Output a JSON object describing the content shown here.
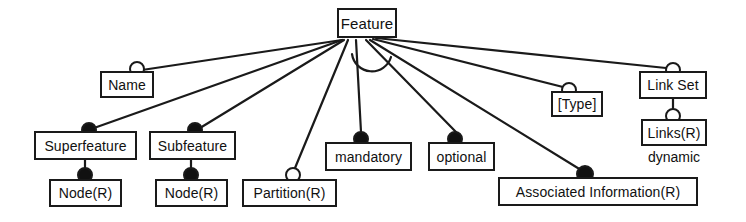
{
  "diagram": {
    "title": "Feature",
    "caption_labels": [
      "dynamic"
    ],
    "colors": {
      "line": "#1a1a1a",
      "box_border": "#1a1a1a",
      "box_fill": "#ffffff",
      "filled_marker": "#111111",
      "open_marker": "#ffffff",
      "text": "#111111"
    },
    "nodes": [
      {
        "id": "feature",
        "label": "Feature",
        "x": 337,
        "y": 8,
        "w": 60,
        "h": 30,
        "font_size": 15
      },
      {
        "id": "name",
        "label": "Name",
        "x": 100,
        "y": 71,
        "w": 54,
        "h": 27,
        "font_size": 14
      },
      {
        "id": "superfeature",
        "label": "Superfeature",
        "x": 34,
        "y": 131,
        "w": 103,
        "h": 29,
        "font_size": 14
      },
      {
        "id": "subfeature",
        "label": "Subfeature",
        "x": 149,
        "y": 131,
        "w": 87,
        "h": 29,
        "font_size": 14
      },
      {
        "id": "node_super",
        "label": "Node(R)",
        "x": 49,
        "y": 179,
        "w": 73,
        "h": 28,
        "font_size": 14
      },
      {
        "id": "node_sub",
        "label": "Node(R)",
        "x": 155,
        "y": 179,
        "w": 73,
        "h": 28,
        "font_size": 14
      },
      {
        "id": "partition",
        "label": "Partition(R)",
        "x": 242,
        "y": 179,
        "w": 95,
        "h": 28,
        "font_size": 14
      },
      {
        "id": "mandatory",
        "label": "mandatory",
        "x": 325,
        "y": 142,
        "w": 87,
        "h": 29,
        "font_size": 14
      },
      {
        "id": "optional",
        "label": "optional",
        "x": 428,
        "y": 142,
        "w": 67,
        "h": 29,
        "font_size": 14
      },
      {
        "id": "type",
        "label": "[Type]",
        "x": 551,
        "y": 91,
        "w": 52,
        "h": 26,
        "font_size": 14
      },
      {
        "id": "linkset",
        "label": "Link Set",
        "x": 639,
        "y": 71,
        "w": 68,
        "h": 28,
        "font_size": 14
      },
      {
        "id": "links",
        "label": "Links(R)",
        "x": 641,
        "y": 119,
        "w": 66,
        "h": 27,
        "font_size": 14
      },
      {
        "id": "assoc_info",
        "label": "Associated Information(R)",
        "x": 498,
        "y": 177,
        "w": 200,
        "h": 29,
        "font_size": 14
      }
    ],
    "free_labels": [
      {
        "id": "dynamic",
        "label": "dynamic",
        "x": 636,
        "y": 150,
        "w": 76,
        "font_size": 14
      }
    ],
    "markers": [
      {
        "id": "marker-name",
        "type": "open",
        "cx": 137,
        "cy": 69,
        "r": 8
      },
      {
        "id": "marker-superfeature",
        "type": "filled",
        "cx": 89,
        "cy": 130,
        "r": 8
      },
      {
        "id": "marker-subfeature",
        "type": "filled",
        "cx": 195,
        "cy": 130,
        "r": 8
      },
      {
        "id": "marker-node-super",
        "type": "filled",
        "cx": 85,
        "cy": 175,
        "r": 8
      },
      {
        "id": "marker-node-sub",
        "type": "filled",
        "cx": 191,
        "cy": 175,
        "r": 8
      },
      {
        "id": "marker-partition",
        "type": "open",
        "cx": 293,
        "cy": 175,
        "r": 8
      },
      {
        "id": "marker-mandatory",
        "type": "filled",
        "cx": 361,
        "cy": 139,
        "r": 8
      },
      {
        "id": "marker-optional",
        "type": "filled",
        "cx": 455,
        "cy": 139,
        "r": 8
      },
      {
        "id": "marker-type",
        "type": "open",
        "cx": 569,
        "cy": 90,
        "r": 8
      },
      {
        "id": "marker-linkset",
        "type": "open",
        "cx": 673,
        "cy": 70,
        "r": 8
      },
      {
        "id": "marker-links",
        "type": "open",
        "cx": 673,
        "cy": 116,
        "r": 8
      },
      {
        "id": "marker-assoc-info",
        "type": "filled",
        "cx": 585,
        "cy": 174,
        "r": 9
      }
    ],
    "edges": [
      {
        "id": "edge-feature-name",
        "from": "feature",
        "to": "name",
        "x1": 342,
        "y1": 40,
        "x2": 142,
        "y2": 70
      },
      {
        "id": "edge-feature-superfeature",
        "from": "feature",
        "to": "superfeature",
        "x1": 342,
        "y1": 40,
        "x2": 94,
        "y2": 128
      },
      {
        "id": "edge-feature-subfeature",
        "from": "feature",
        "to": "subfeature",
        "x1": 344,
        "y1": 40,
        "x2": 200,
        "y2": 128
      },
      {
        "id": "edge-feature-partition",
        "from": "feature",
        "to": "partition",
        "x1": 348,
        "y1": 40,
        "x2": 295,
        "y2": 168
      },
      {
        "id": "edge-feature-mandatory",
        "from": "feature",
        "to": "mandatory",
        "x1": 356,
        "y1": 40,
        "x2": 361,
        "y2": 132
      },
      {
        "id": "edge-feature-optional",
        "from": "feature",
        "to": "optional",
        "x1": 366,
        "y1": 40,
        "x2": 456,
        "y2": 132
      },
      {
        "id": "edge-feature-assoc-info",
        "from": "feature",
        "to": "assoc_info",
        "x1": 370,
        "y1": 40,
        "x2": 581,
        "y2": 170
      },
      {
        "id": "edge-feature-type",
        "from": "feature",
        "to": "type",
        "x1": 373,
        "y1": 39,
        "x2": 563,
        "y2": 87
      },
      {
        "id": "edge-feature-linkset",
        "from": "feature",
        "to": "linkset",
        "x1": 376,
        "y1": 38,
        "x2": 666,
        "y2": 68
      },
      {
        "id": "edge-superfeature-node",
        "from": "superfeature",
        "to": "node_super",
        "x1": 85,
        "y1": 160,
        "x2": 85,
        "y2": 180
      },
      {
        "id": "edge-subfeature-node",
        "from": "subfeature",
        "to": "node_sub",
        "x1": 191,
        "y1": 160,
        "x2": 191,
        "y2": 180
      },
      {
        "id": "edge-linkset-links",
        "from": "linkset",
        "to": "links",
        "x1": 673,
        "y1": 99,
        "x2": 673,
        "y2": 120
      }
    ],
    "arcs": [
      {
        "id": "alternative-arc",
        "between": [
          "edge-feature-mandatory",
          "edge-feature-optional"
        ],
        "d": "M 352 54 A 20 20 0 0 0 391 57"
      }
    ]
  }
}
